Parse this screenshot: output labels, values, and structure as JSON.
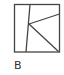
{
  "figure": {
    "label": "B",
    "stroke_color": "#444444",
    "background": "#ffffff"
  }
}
